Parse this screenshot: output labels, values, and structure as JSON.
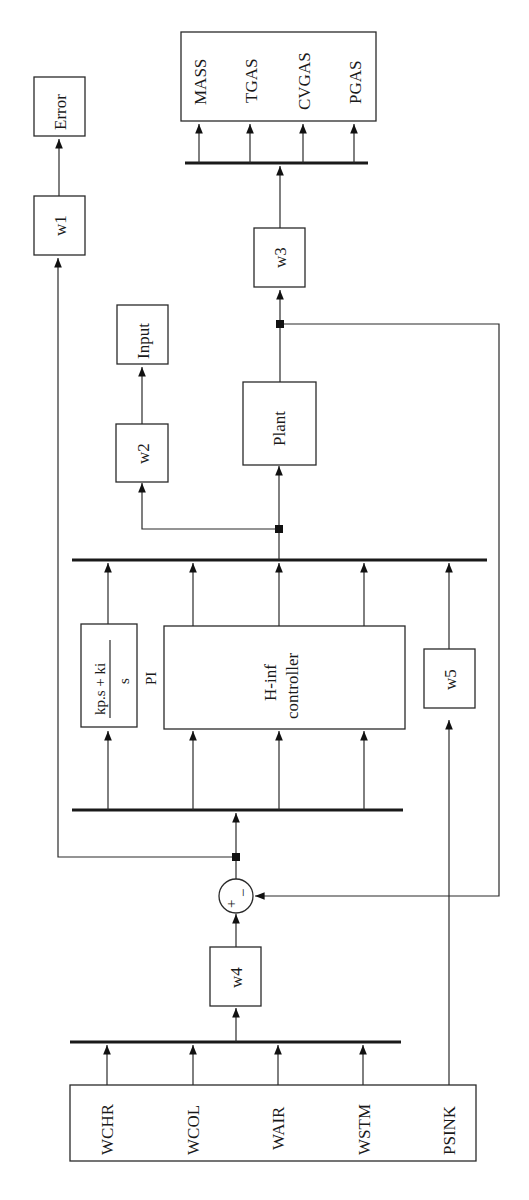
{
  "diagram": {
    "orientation": "rotated-90-ccw",
    "blocks": {
      "error": "Error",
      "w1": "w1",
      "input": "Input",
      "w2": "w2",
      "plant": "Plant",
      "w3": "w3",
      "w4": "w4",
      "w5": "w5",
      "pi_numerator": "kp.s + ki",
      "pi_denominator": "s",
      "pi_label": "PI",
      "hinf_line1": "H-inf",
      "hinf_line2": "controller",
      "sum_plus": "+",
      "sum_minus": "−"
    },
    "outputs": [
      "MASS",
      "TGAS",
      "CVGAS",
      "PGAS"
    ],
    "inputs": [
      "WCHR",
      "WCOL",
      "WAIR",
      "WSTM",
      "PSINK"
    ]
  }
}
